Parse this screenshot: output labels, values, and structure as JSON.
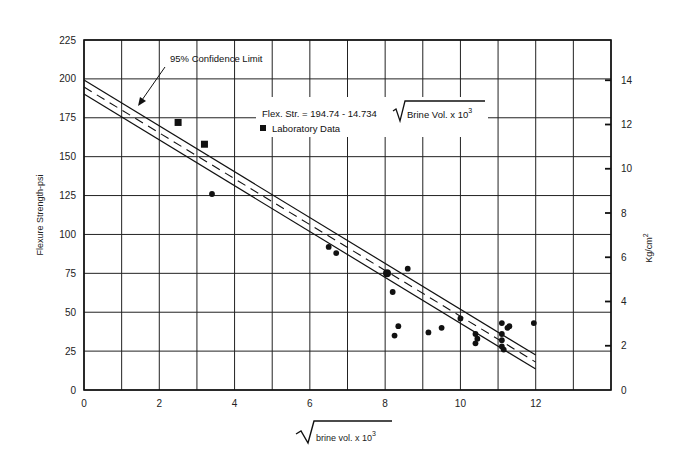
{
  "chart_data": {
    "type": "scatter",
    "title": "",
    "xlabel": "√ brine vol. x 10³",
    "xlabel_radicand": "brine vol. x 10",
    "xlabel_exponent": "3",
    "ylabel": "Flexure Strength-psi",
    "y2label": "Kg/cm",
    "y2label_exponent": "2",
    "xlim": [
      0,
      14
    ],
    "ylim": [
      0,
      225
    ],
    "y2lim_kgcm2": [
      0,
      15.82
    ],
    "grid": true,
    "x_ticks": [
      0,
      2,
      4,
      6,
      8,
      10,
      12
    ],
    "x_grid": [
      0,
      1,
      2,
      3,
      4,
      5,
      6,
      7,
      8,
      9,
      10,
      11,
      12,
      13,
      14
    ],
    "y_ticks": [
      0,
      25,
      50,
      75,
      100,
      125,
      150,
      175,
      200,
      225
    ],
    "y2_ticks": [
      0,
      2,
      4,
      6,
      8,
      10,
      12,
      14
    ],
    "regression": {
      "equation_text": "Flex. Str. = 194.74 - 14.734",
      "equation_radicand": "Brine Vol. x 10",
      "equation_exponent": "3",
      "intercept": 194.74,
      "slope": -14.734,
      "x_range": [
        0,
        12
      ],
      "confidence_offset": 4.5,
      "confidence_label": "95% Confidence Limit"
    },
    "legend": [
      {
        "label": "Laboratory Data",
        "marker": "square"
      }
    ],
    "series": [
      {
        "name": "Laboratory Data",
        "marker": "square",
        "points": [
          [
            2.5,
            172
          ],
          [
            3.2,
            158
          ]
        ]
      },
      {
        "name": "Field Data",
        "marker": "circle",
        "points": [
          [
            3.4,
            126
          ],
          [
            6.5,
            92
          ],
          [
            6.7,
            88
          ],
          [
            8.05,
            75
          ],
          [
            8.6,
            78
          ],
          [
            8.2,
            63
          ],
          [
            8.35,
            41
          ],
          [
            8.25,
            35
          ],
          [
            9.15,
            37
          ],
          [
            9.5,
            40
          ],
          [
            10.0,
            46
          ],
          [
            10.4,
            36
          ],
          [
            10.45,
            33
          ],
          [
            10.4,
            30
          ],
          [
            11.1,
            43
          ],
          [
            11.25,
            40
          ],
          [
            11.3,
            41
          ],
          [
            11.1,
            36
          ],
          [
            11.1,
            32
          ],
          [
            11.1,
            28
          ],
          [
            11.15,
            26
          ],
          [
            11.95,
            43
          ]
        ]
      }
    ]
  }
}
